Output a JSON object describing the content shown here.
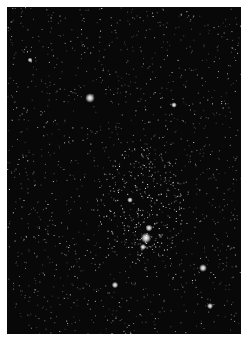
{
  "image": {
    "subject": "star field",
    "description": "Dense starry night sky photograph with a brighter star cluster near lower center",
    "frame_color": "#ffffff",
    "sky_color": "#080808",
    "bright_stars": [
      {
        "x": 90,
        "y": 98,
        "r": 2.2
      },
      {
        "x": 146,
        "y": 238,
        "r": 2.4
      },
      {
        "x": 149,
        "y": 228,
        "r": 1.6
      },
      {
        "x": 143,
        "y": 247,
        "r": 1.4
      },
      {
        "x": 203,
        "y": 268,
        "r": 1.8
      },
      {
        "x": 174,
        "y": 105,
        "r": 1.3
      },
      {
        "x": 130,
        "y": 200,
        "r": 1.3
      },
      {
        "x": 115,
        "y": 285,
        "r": 1.5
      },
      {
        "x": 210,
        "y": 306,
        "r": 1.4
      },
      {
        "x": 30,
        "y": 60,
        "r": 1.1
      }
    ],
    "background_star_count": 1400,
    "cluster": {
      "x": 140,
      "y": 205,
      "radius": 45,
      "count": 260
    }
  }
}
